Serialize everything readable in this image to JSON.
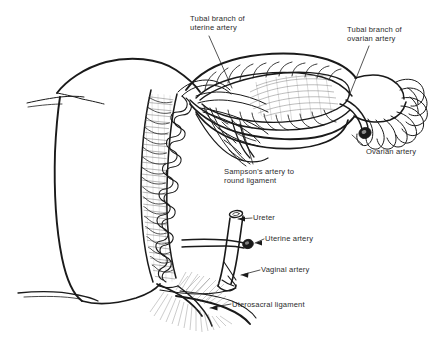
{
  "figure": {
    "background_color": "#ffffff",
    "ink_color": "#1a1a1a",
    "text_color": "#2b2b2b",
    "shading_color": "#8a8a8a"
  },
  "labels": {
    "tubal_branch_uterine": "Tubal branch of\nuterine artery",
    "tubal_branch_ovarian": "Tubal branch of\novarian artery",
    "sampsons_artery": "Sampson's artery to\nround ligament",
    "ovarian_artery": "Ovarian artery",
    "ureter": "Ureter",
    "uterine_artery": "Uterine artery",
    "vaginal_artery": "Vaginal artery",
    "uterosacral_ligament": "Uterosacral ligament"
  },
  "structures": [
    {
      "name": "uterus-body",
      "description": "Uterine corpus shown in sagittal/coronal cut with myometrial wall"
    },
    {
      "name": "uterine-wall-hatching",
      "description": "Myometrium with arcuate vessels"
    },
    {
      "name": "uterine-artery-coils",
      "description": "Tortuous uterine artery ascending along lateral uterine border"
    },
    {
      "name": "fallopian-tube",
      "description": "Fallopian tube opened to show vascular arcade"
    },
    {
      "name": "ovary",
      "description": "Ovary with stromal hatching in broad ligament"
    },
    {
      "name": "mesosalpinx",
      "description": "Broad ligament / mesosalpinx"
    },
    {
      "name": "fimbriae",
      "description": "Fimbriated end of the fallopian tube"
    },
    {
      "name": "ovarian-artery-stump",
      "description": "Cut end of ovarian artery, darkened cross-section"
    },
    {
      "name": "uterine-artery-stump",
      "description": "Cut end of uterine artery, darkened cross-section"
    },
    {
      "name": "ureter-tube",
      "description": "Ureter descending with cut upper end"
    },
    {
      "name": "vagina",
      "description": "Upper vagina with paracolpium"
    },
    {
      "name": "uterosacral-ligament",
      "description": "Uterosacral ligament fanning posteriorly"
    }
  ]
}
